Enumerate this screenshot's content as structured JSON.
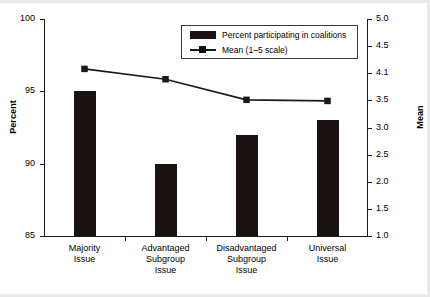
{
  "chart_data": {
    "type": "bar",
    "title": "",
    "subtitle": "",
    "categories": [
      "Majority\nIssue",
      "Advantaged\nSubgroup\nIssue",
      "Disadvantaged\nSubgroup\nIssue",
      "Universal\nIssue"
    ],
    "category_lines": [
      [
        "Majority",
        "Issue"
      ],
      [
        "Advantaged",
        "Subgroup",
        "Issue"
      ],
      [
        "Disadvantaged",
        "Subgroup",
        "Issue"
      ],
      [
        "Universal",
        "Issue"
      ]
    ],
    "series": [
      {
        "name": "Percent participating in coalitions",
        "type": "bar",
        "axis": "left",
        "values": [
          95,
          90,
          92,
          93
        ],
        "color": "#1a1210"
      },
      {
        "name": "Mean (1–5 scale)",
        "type": "line",
        "axis": "right",
        "values": [
          4.08,
          3.89,
          3.51,
          3.49
        ],
        "color": "#1a1a1a",
        "marker": "square"
      }
    ],
    "xlabel": "",
    "ylabel": "Percent",
    "ylabel_right": "Mean",
    "ylim": [
      85,
      100
    ],
    "ylim_right": [
      1.0,
      5.0
    ],
    "yticks_left": [
      "100",
      "95",
      "90",
      "85"
    ],
    "yticks_left_values": [
      100,
      95,
      90,
      85
    ],
    "yticks_right": [
      "5.0",
      "4.5",
      "4.1",
      "3.5",
      "3.0",
      "2.5",
      "2.0",
      "1.5",
      "1.0"
    ],
    "yticks_right_values": [
      5.0,
      4.5,
      4.0,
      3.5,
      3.0,
      2.5,
      2.0,
      1.5,
      1.0
    ],
    "grid": false,
    "legend_position": "top-center",
    "legend_entries": [
      "Percent participating in coalitions",
      "Mean (1–5 scale)"
    ]
  },
  "axes": {
    "left_title": "Percent",
    "right_title": "Mean"
  },
  "legend": {
    "bar_label": "Percent participating in coalitions",
    "line_label": "Mean (1–5 scale)"
  }
}
